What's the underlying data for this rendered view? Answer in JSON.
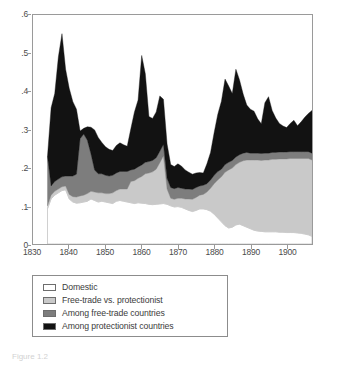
{
  "figure": {
    "caption": "Figure 1.2"
  },
  "legend": {
    "items": [
      {
        "label": "Domestic",
        "color": "#ffffff",
        "key": "domestic"
      },
      {
        "label": "Free-trade vs. protectionist",
        "color": "#c9c9c9",
        "key": "free_vs_prot"
      },
      {
        "label": "Among free-trade countries",
        "color": "#7d7d7d",
        "key": "among_free"
      },
      {
        "label": "Among protectionist countries",
        "color": "#121212",
        "key": "among_prot"
      }
    ]
  },
  "chart_data": {
    "type": "area",
    "stacked": true,
    "title": "",
    "xlabel": "",
    "ylabel": "",
    "xlim": [
      1830,
      1907
    ],
    "ylim": [
      0,
      0.6
    ],
    "grid": false,
    "legend_position": "below-plot",
    "ytick_labels": [
      "0",
      ".1",
      ".2",
      ".3",
      ".4",
      ".5",
      ".6"
    ],
    "ytick_values": [
      0,
      0.1,
      0.2,
      0.3,
      0.4,
      0.5,
      0.6
    ],
    "xtick_labels": [
      "1830",
      "1840",
      "1850",
      "1860",
      "1870",
      "1880",
      "1890",
      "1900"
    ],
    "xtick_values": [
      1830,
      1840,
      1850,
      1860,
      1870,
      1880,
      1890,
      1900
    ],
    "x": [
      1834,
      1835,
      1836,
      1837,
      1838,
      1839,
      1840,
      1841,
      1842,
      1843,
      1844,
      1845,
      1846,
      1847,
      1848,
      1849,
      1850,
      1851,
      1852,
      1853,
      1854,
      1855,
      1856,
      1857,
      1858,
      1859,
      1860,
      1861,
      1862,
      1863,
      1864,
      1865,
      1866,
      1867,
      1868,
      1869,
      1870,
      1871,
      1872,
      1873,
      1874,
      1875,
      1876,
      1877,
      1878,
      1879,
      1880,
      1881,
      1882,
      1883,
      1884,
      1885,
      1886,
      1887,
      1888,
      1889,
      1890,
      1891,
      1892,
      1893,
      1894,
      1895,
      1896,
      1897,
      1898,
      1899,
      1900,
      1901,
      1902,
      1903,
      1904,
      1905,
      1906,
      1907
    ],
    "series": [
      {
        "name": "Domestic",
        "color": "#ffffff",
        "values": [
          0.092,
          0.118,
          0.128,
          0.134,
          0.14,
          0.142,
          0.118,
          0.11,
          0.107,
          0.108,
          0.11,
          0.112,
          0.118,
          0.114,
          0.11,
          0.112,
          0.11,
          0.108,
          0.106,
          0.112,
          0.114,
          0.112,
          0.11,
          0.108,
          0.106,
          0.108,
          0.107,
          0.106,
          0.104,
          0.103,
          0.104,
          0.105,
          0.106,
          0.104,
          0.1,
          0.097,
          0.098,
          0.096,
          0.092,
          0.088,
          0.085,
          0.088,
          0.092,
          0.092,
          0.09,
          0.086,
          0.078,
          0.068,
          0.058,
          0.048,
          0.042,
          0.044,
          0.05,
          0.052,
          0.048,
          0.044,
          0.04,
          0.036,
          0.034,
          0.033,
          0.032,
          0.032,
          0.032,
          0.032,
          0.031,
          0.031,
          0.03,
          0.03,
          0.03,
          0.029,
          0.028,
          0.026,
          0.024,
          0.02
        ]
      },
      {
        "name": "Free-trade vs. protectionist",
        "color": "#c9c9c9",
        "values": [
          0.008,
          0.01,
          0.01,
          0.01,
          0.01,
          0.01,
          0.012,
          0.014,
          0.016,
          0.018,
          0.018,
          0.02,
          0.02,
          0.022,
          0.024,
          0.022,
          0.022,
          0.024,
          0.028,
          0.028,
          0.03,
          0.032,
          0.034,
          0.056,
          0.06,
          0.064,
          0.07,
          0.078,
          0.082,
          0.086,
          0.092,
          0.108,
          0.125,
          0.04,
          0.02,
          0.02,
          0.022,
          0.024,
          0.026,
          0.03,
          0.032,
          0.034,
          0.036,
          0.038,
          0.046,
          0.06,
          0.08,
          0.1,
          0.118,
          0.14,
          0.152,
          0.155,
          0.158,
          0.162,
          0.17,
          0.176,
          0.18,
          0.184,
          0.186,
          0.186,
          0.188,
          0.188,
          0.19,
          0.19,
          0.192,
          0.192,
          0.193,
          0.194,
          0.194,
          0.195,
          0.196,
          0.198,
          0.2,
          0.2
        ]
      },
      {
        "name": "Among free-trade countries",
        "color": "#7d7d7d",
        "values": [
          0.13,
          0.024,
          0.026,
          0.026,
          0.026,
          0.026,
          0.048,
          0.054,
          0.06,
          0.15,
          0.16,
          0.14,
          0.098,
          0.058,
          0.05,
          0.05,
          0.048,
          0.046,
          0.046,
          0.046,
          0.046,
          0.046,
          0.046,
          0.03,
          0.03,
          0.03,
          0.03,
          0.03,
          0.03,
          0.03,
          0.03,
          0.03,
          0.03,
          0.028,
          0.028,
          0.028,
          0.028,
          0.026,
          0.026,
          0.026,
          0.026,
          0.026,
          0.024,
          0.024,
          0.022,
          0.022,
          0.022,
          0.022,
          0.02,
          0.02,
          0.02,
          0.02,
          0.02,
          0.02,
          0.02,
          0.02,
          0.018,
          0.018,
          0.018,
          0.018,
          0.018,
          0.018,
          0.018,
          0.018,
          0.018,
          0.018,
          0.018,
          0.018,
          0.018,
          0.018,
          0.018,
          0.018,
          0.018,
          0.018
        ]
      },
      {
        "name": "Among protectionist countries",
        "color": "#121212",
        "values": [
          0.0,
          0.205,
          0.23,
          0.32,
          0.375,
          0.28,
          0.23,
          0.195,
          0.17,
          0.02,
          0.015,
          0.035,
          0.07,
          0.105,
          0.095,
          0.082,
          0.075,
          0.07,
          0.065,
          0.072,
          0.075,
          0.07,
          0.066,
          0.108,
          0.15,
          0.175,
          0.287,
          0.232,
          0.118,
          0.11,
          0.12,
          0.145,
          0.118,
          0.09,
          0.06,
          0.058,
          0.062,
          0.058,
          0.05,
          0.044,
          0.04,
          0.038,
          0.035,
          0.032,
          0.052,
          0.072,
          0.112,
          0.15,
          0.178,
          0.224,
          0.2,
          0.175,
          0.23,
          0.196,
          0.155,
          0.124,
          0.115,
          0.11,
          0.09,
          0.078,
          0.132,
          0.148,
          0.11,
          0.09,
          0.075,
          0.068,
          0.064,
          0.074,
          0.082,
          0.068,
          0.078,
          0.09,
          0.1,
          0.112
        ]
      }
    ]
  }
}
